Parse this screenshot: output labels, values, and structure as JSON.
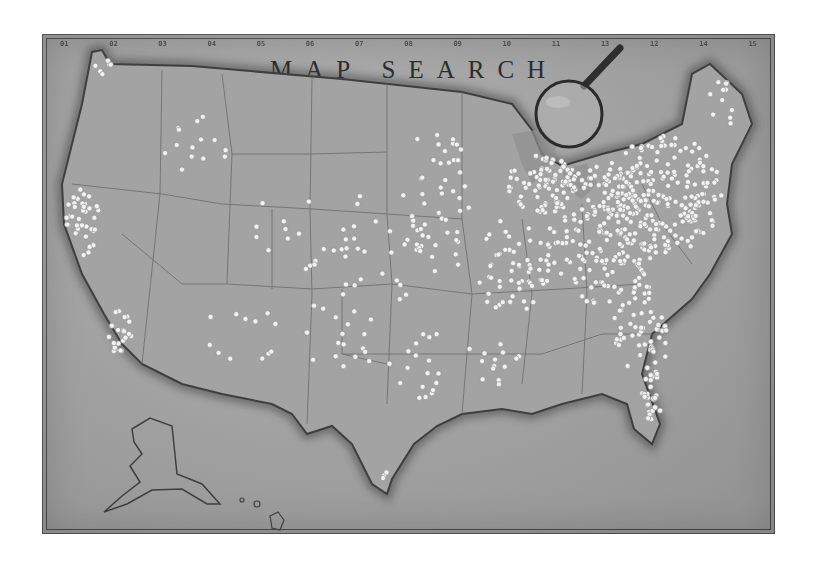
{
  "map": {
    "title": "MAP SEARCH",
    "column_ticks": [
      "01",
      "02",
      "03",
      "04",
      "05",
      "06",
      "07",
      "08",
      "09",
      "10",
      "11",
      "13",
      "12",
      "14",
      "15"
    ],
    "colors": {
      "paper": "#a9a9a9",
      "border": "#4a4a4a",
      "coastline": "#3f3f3f",
      "state_lines": "#6e6e6e",
      "pin": "#f2f2f2",
      "title_text": "#2c2c2c"
    },
    "regions": [
      "Contiguous United States",
      "Alaska",
      "Hawaii"
    ],
    "decorations": [
      "magnifying-glass"
    ],
    "pin_density": {
      "northeast": "very high",
      "southeast": "high",
      "midwest": "high",
      "california_coast": "high",
      "great_plains": "low",
      "mountain_west": "low",
      "florida_coast": "high",
      "texas": "moderate"
    }
  }
}
